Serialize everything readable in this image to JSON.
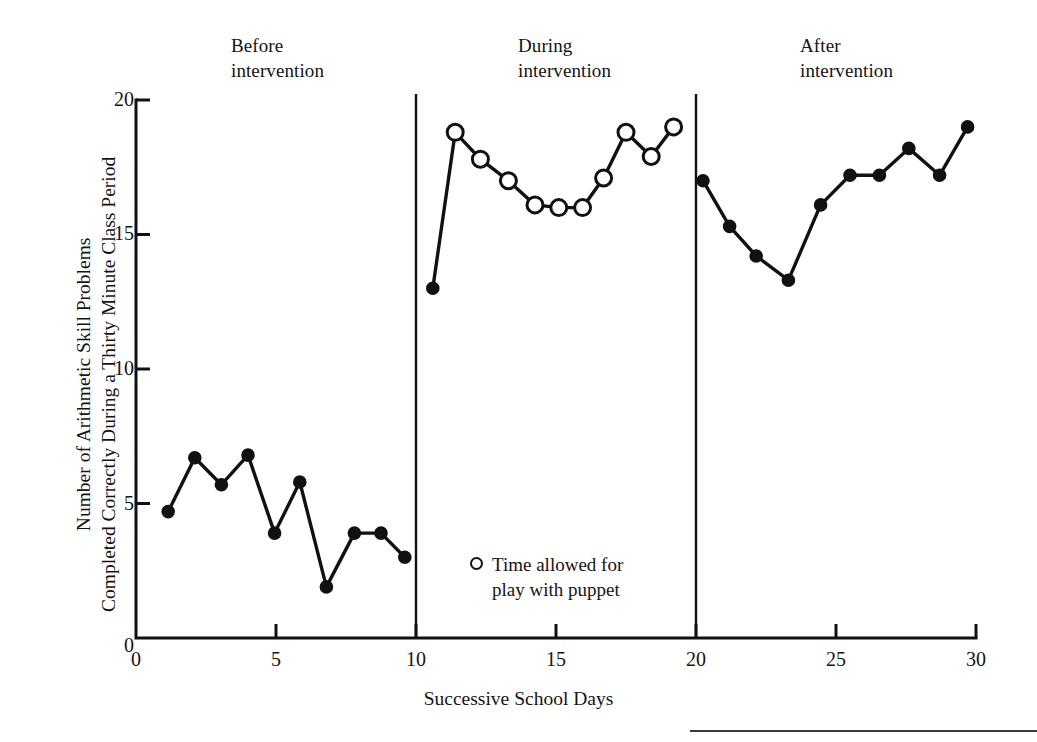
{
  "figure": {
    "background_color": "#ffffff",
    "ink_color": "#111111"
  },
  "axes": {
    "x_title": "Successive School Days",
    "y_title": "Number of Arithmetic Skill Problems\nCompleted Correctly During a Thirty Minute Class Period",
    "x_ticks": [
      "0",
      "5",
      "10",
      "15",
      "20",
      "25",
      "30"
    ],
    "y_ticks": [
      "20",
      "15",
      "10",
      "5",
      "0"
    ]
  },
  "phases": [
    {
      "id": "before",
      "label": "Before\nintervention"
    },
    {
      "id": "during",
      "label": "During\nintervention"
    },
    {
      "id": "after",
      "label": "After\nintervention"
    }
  ],
  "legend": {
    "marker": "open-circle",
    "text": "Time allowed for\nplay with puppet"
  },
  "chart_data": {
    "type": "line",
    "title": "",
    "xlabel": "Successive School Days",
    "ylabel": "Number of Arithmetic Skill Problems Completed Correctly During a Thirty Minute Class Period",
    "xlim": [
      0,
      30
    ],
    "ylim": [
      0,
      20
    ],
    "xticks": [
      0,
      5,
      10,
      15,
      20,
      25,
      30
    ],
    "yticks": [
      0,
      5,
      10,
      15,
      20
    ],
    "grid": false,
    "legend_position": "inside-lower-center",
    "legend_entries": [
      {
        "marker": "open-circle",
        "label": "Time allowed for play with puppet"
      }
    ],
    "phase_lines_x": [
      10,
      20
    ],
    "phase_annotations": [
      {
        "label": "Before intervention",
        "x_center": 5
      },
      {
        "label": "During intervention",
        "x_center": 15
      },
      {
        "label": "After intervention",
        "x_center": 25
      }
    ],
    "series": [
      {
        "name": "Before intervention",
        "marker": "filled-circle",
        "x": [
          1.15,
          2.1,
          3.05,
          4.0,
          4.95,
          5.85,
          6.8,
          7.8,
          8.75,
          9.6
        ],
        "values": [
          4.7,
          6.7,
          5.7,
          6.8,
          3.9,
          5.8,
          1.9,
          3.9,
          3.9,
          3.0
        ]
      },
      {
        "name": "During intervention",
        "marker": "mixed",
        "x": [
          10.6,
          11.4,
          12.3,
          13.3,
          14.25,
          15.1,
          15.95,
          16.7,
          17.5,
          18.4,
          19.2
        ],
        "values": [
          13.0,
          18.8,
          17.8,
          17.0,
          16.1,
          16.0,
          16.0,
          17.1,
          18.8,
          17.9,
          19.0
        ],
        "markers": [
          "filled-circle",
          "open-circle",
          "open-circle",
          "open-circle",
          "open-circle",
          "open-circle",
          "open-circle",
          "open-circle",
          "open-circle",
          "open-circle",
          "open-circle"
        ]
      },
      {
        "name": "After intervention",
        "marker": "filled-circle",
        "x": [
          20.25,
          21.2,
          22.15,
          23.3,
          24.45,
          25.5,
          26.55,
          27.6,
          28.7,
          29.7
        ],
        "values": [
          17.0,
          15.3,
          14.2,
          13.3,
          16.1,
          17.2,
          17.2,
          18.2,
          17.2,
          19.0
        ]
      }
    ]
  }
}
